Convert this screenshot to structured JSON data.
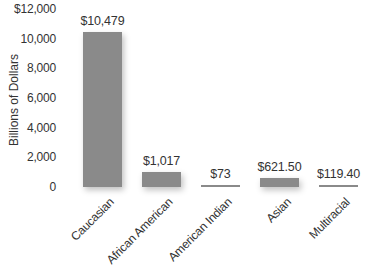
{
  "chart_data": {
    "type": "bar",
    "title": "",
    "xlabel": "",
    "ylabel": "Billions of Dollars",
    "categories": [
      "Caucasian",
      "African American",
      "American Indian",
      "Asian",
      "Multiracial"
    ],
    "values": [
      10479,
      1017,
      73,
      621.5,
      119.4
    ],
    "data_labels": [
      "$10,479",
      "$1,017",
      "$73",
      "$621.50",
      "$119.40"
    ],
    "ylim": [
      0,
      12000
    ],
    "yticks": [
      0,
      2000,
      4000,
      6000,
      8000,
      10000,
      12000
    ],
    "ytick_labels": [
      "0",
      "2,000",
      "4,000",
      "6,000",
      "8,000",
      "10,000",
      "$12,000"
    ],
    "grid": false,
    "legend": null,
    "bar_color": "#8a8a8a"
  }
}
